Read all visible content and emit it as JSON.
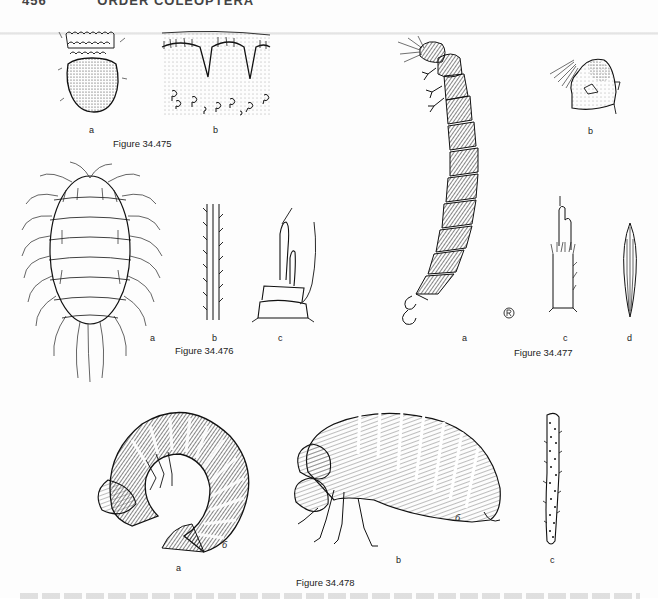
{
  "page": {
    "running_head": {
      "page_number": "456",
      "title": "ORDER COLEOPTERA"
    }
  },
  "figures": [
    {
      "id": "34.475",
      "caption": "Figure 34.475",
      "panels": [
        {
          "label": "a",
          "description": "stippled rounded segment with scalloped fringed bands"
        },
        {
          "label": "b",
          "description": "stippled cuticle with scalloped hairy margin and coiled setae"
        }
      ]
    },
    {
      "id": "34.476",
      "caption": "Figure 34.476",
      "panels": [
        {
          "label": "a",
          "description": "oval densely long-haired larva, dorsal view"
        },
        {
          "label": "b",
          "description": "barbed seta detail"
        },
        {
          "label": "c",
          "description": "antenna segments"
        }
      ]
    },
    {
      "id": "34.477",
      "caption": "Figure 34.477",
      "panels": [
        {
          "label": "a",
          "description": "elongate segmented larva, lateral view, with hooked terminal appendages"
        },
        {
          "label": "b",
          "description": "head detail with stippled shading"
        },
        {
          "label": "c",
          "description": "antenna with setose base"
        },
        {
          "label": "d",
          "description": "lanceolate striated scale"
        }
      ],
      "artist_mark": "®-like circled monogram"
    },
    {
      "id": "34.478",
      "caption": "Figure 34.478",
      "panels": [
        {
          "label": "a",
          "description": "curled C-shaped darkly banded larva"
        },
        {
          "label": "b",
          "description": "plump segmented larva, lateral view, with legs"
        },
        {
          "label": "c",
          "description": "spiny seta detail"
        }
      ],
      "artist_signature": "б"
    }
  ]
}
